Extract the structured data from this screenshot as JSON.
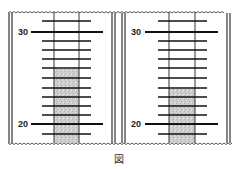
{
  "caption": "図",
  "panels": [
    {
      "id": "left",
      "labels": {
        "top": "30",
        "bottom": "20"
      },
      "fill_top_y": 69
    },
    {
      "id": "right",
      "labels": {
        "top": "30",
        "bottom": "20"
      },
      "fill_top_y": 89
    }
  ],
  "colors": {
    "line": "#1a1a1a",
    "fill": "#c8c8c8",
    "wall": "#333333"
  }
}
